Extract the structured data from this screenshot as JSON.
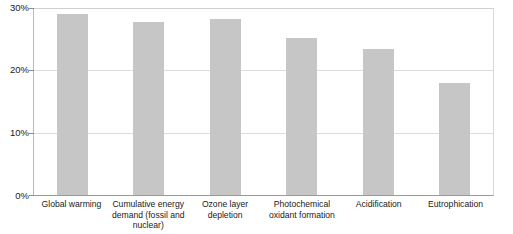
{
  "chart_data": {
    "type": "bar",
    "title": "",
    "xlabel": "",
    "ylabel": "",
    "categories": [
      "Global warming",
      "Cumulative energy demand (fossil and nuclear)",
      "Ozone layer depletion",
      "Photochemical oxidant formation",
      "Acidification",
      "Eutrophication"
    ],
    "values": [
      29.0,
      27.7,
      28.3,
      25.2,
      23.4,
      18.0
    ],
    "value_unit": "%",
    "ylim": [
      0,
      30
    ],
    "yticks": [
      0,
      10,
      20,
      30
    ],
    "ytick_labels": [
      "0%",
      "10%",
      "20%",
      "30%"
    ],
    "grid": true,
    "legend": "none",
    "bar_color": "#c6c6c6",
    "axis_color": "#9a9a9a",
    "grid_color": "#dcdcdc",
    "background": "#ffffff"
  }
}
